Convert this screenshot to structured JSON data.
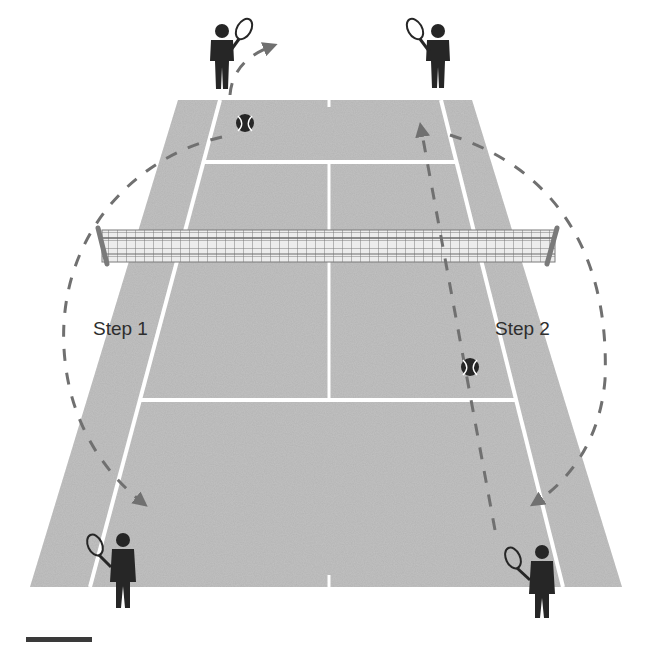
{
  "diagram": {
    "type": "tennis-court-drill",
    "labels": {
      "step1": "Step 1",
      "step2": "Step 2"
    },
    "colors": {
      "court": "#b4b4b4",
      "lines": "#ffffff",
      "player": "#262626",
      "path": "#707070",
      "net": "#8a8a8a",
      "background": "#ffffff"
    },
    "players": [
      {
        "id": "far-left",
        "position": "top-left baseline",
        "racket_side": "right"
      },
      {
        "id": "far-right",
        "position": "top-right baseline",
        "racket_side": "left"
      },
      {
        "id": "near-left",
        "position": "bottom-left baseline",
        "racket_side": "left"
      },
      {
        "id": "near-right",
        "position": "bottom-right baseline",
        "racket_side": "left"
      }
    ],
    "balls": [
      {
        "id": "ball-far",
        "position": "far left service box"
      },
      {
        "id": "ball-near",
        "position": "near right service box"
      }
    ],
    "paths": [
      {
        "id": "step1-arc",
        "description": "dashed arc from far-left player around left side to near-left court"
      },
      {
        "id": "step2-arc",
        "description": "dashed arc from far-right court around right side to near-right court"
      },
      {
        "id": "return-line",
        "description": "dashed straight line from near-right baseline up to far-right service box"
      },
      {
        "id": "small-arc",
        "description": "short dashed arc from far-left player curving right"
      }
    ],
    "scale_bar": true
  }
}
